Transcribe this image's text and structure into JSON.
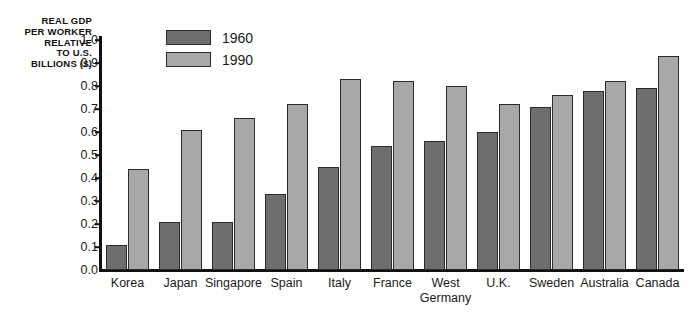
{
  "chart_data": {
    "type": "bar",
    "title": "",
    "xlabel": "",
    "ylabel": "REAL GDP\nPER WORKER\nRELATIVE\nTO U.S.\nBILLIONS ($)",
    "ylim": [
      0.0,
      1.0
    ],
    "ytick_labels": [
      "1.0",
      "0.9",
      "0.8",
      "0.7",
      "0.6",
      "0.5",
      "0.4",
      "0.3",
      "0.2",
      "0.1",
      "0.0"
    ],
    "ytick_values": [
      1.0,
      0.9,
      0.8,
      0.7,
      0.6,
      0.5,
      0.4,
      0.3,
      0.2,
      0.1,
      0.0
    ],
    "grid": false,
    "legend_position": "top-left-inside",
    "categories": [
      "Korea",
      "Japan",
      "Singapore",
      "Spain",
      "Italy",
      "France",
      "West\nGermany",
      "U.K.",
      "Sweden",
      "Australia",
      "Canada"
    ],
    "series": [
      {
        "name": "1960",
        "color": "#6e6e6e",
        "values": [
          0.11,
          0.21,
          0.21,
          0.33,
          0.45,
          0.54,
          0.56,
          0.6,
          0.71,
          0.78,
          0.79
        ]
      },
      {
        "name": "1990",
        "color": "#a8a8a8",
        "values": [
          0.44,
          0.61,
          0.66,
          0.72,
          0.83,
          0.82,
          0.8,
          0.72,
          0.76,
          0.82,
          0.93
        ]
      }
    ]
  },
  "legend": {
    "items": [
      {
        "label": "1960",
        "color": "#6e6e6e"
      },
      {
        "label": "1990",
        "color": "#a8a8a8"
      }
    ]
  }
}
